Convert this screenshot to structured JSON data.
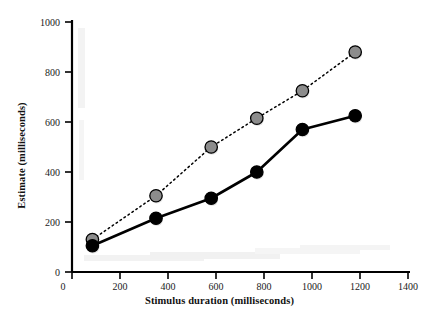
{
  "chart_data": {
    "type": "line",
    "title": "",
    "xlabel": "Stimulus duration (milliseconds)",
    "ylabel": "Estimate (milliseconds)",
    "xlim": [
      0,
      1400
    ],
    "ylim": [
      0,
      1000
    ],
    "xticks": [
      0,
      200,
      400,
      600,
      800,
      1000,
      1200,
      1400
    ],
    "xticklabels": [
      "0",
      "200",
      "400",
      "600",
      "800",
      "1000",
      "1200",
      "1400"
    ],
    "yticks": [
      0,
      200,
      400,
      600,
      800,
      1000
    ],
    "yticklabels": [
      "0",
      "200",
      "400",
      "600",
      "800",
      "1000"
    ],
    "grid": false,
    "legend": "none",
    "series": [
      {
        "name": "gray-dotted-series",
        "marker": "circle",
        "marker_fill": "#8c8c8c",
        "marker_edge": "#000000",
        "line_style": "dotted",
        "line_color": "#000000",
        "x": [
          85,
          350,
          580,
          770,
          960,
          1180
        ],
        "y": [
          130,
          305,
          500,
          615,
          725,
          880
        ]
      },
      {
        "name": "black-solid-series",
        "marker": "circle",
        "marker_fill": "#000000",
        "marker_edge": "#000000",
        "line_style": "solid",
        "line_color": "#000000",
        "x": [
          85,
          350,
          580,
          770,
          960,
          1180
        ],
        "y": [
          105,
          215,
          295,
          400,
          570,
          625
        ]
      }
    ]
  },
  "axis": {
    "x_title": "Stimulus duration (milliseconds)",
    "y_title": "Estimate (milliseconds)"
  },
  "ticks": {
    "x_labels": [
      "0",
      "200",
      "400",
      "600",
      "800",
      "1000",
      "1200",
      "1400"
    ],
    "y_labels": [
      "0",
      "200",
      "400",
      "600",
      "800",
      "1000"
    ]
  },
  "colors": {
    "axis": "#000000",
    "gray_marker": "#8c8c8c",
    "black_marker": "#000000",
    "background": "#ffffff"
  }
}
